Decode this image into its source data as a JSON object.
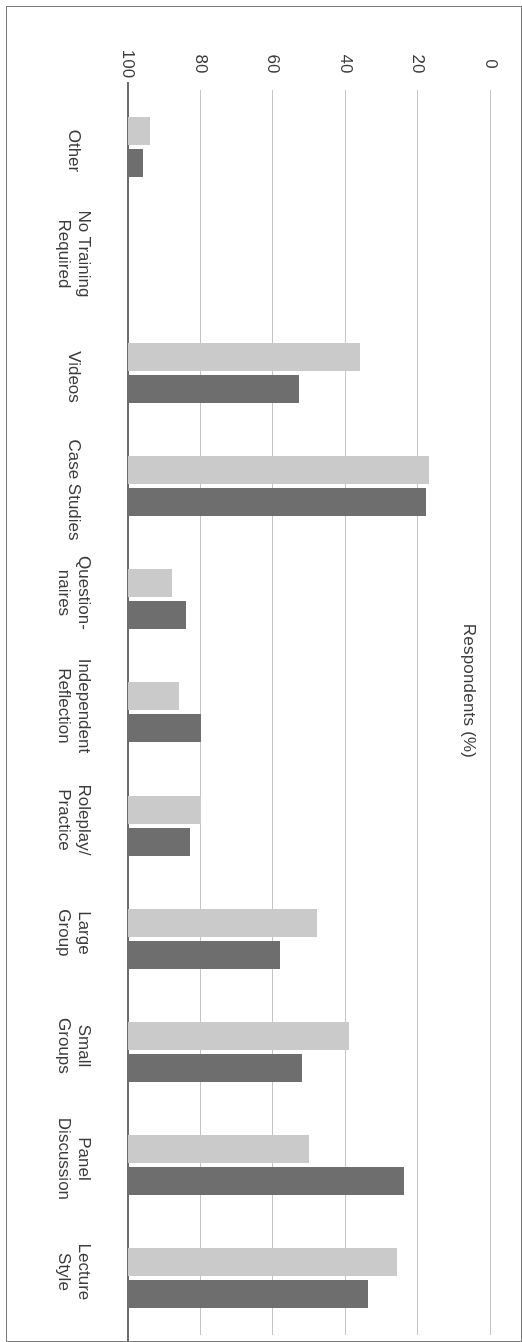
{
  "chart_data": {
    "type": "bar",
    "orientation": "horizontal",
    "title": "",
    "subtitle": "",
    "xlabel": "",
    "ylabel": "Respondents (%)",
    "value_axis_label": "Respondents (%)",
    "value_axis_ticks": [
      0,
      20,
      40,
      60,
      80,
      100
    ],
    "value_axis_tick_labels": [
      "0",
      "20",
      "40",
      "60",
      "80",
      "100"
    ],
    "ylim": [
      0,
      100
    ],
    "grid": true,
    "grid_axis": "value",
    "legend_position": "inside-right",
    "categories": [
      "Lecture Style",
      "Panel Discussion",
      "Small Groups",
      "Large Group",
      "Roleplay/ Practice",
      "Independent Reflection",
      "Question- naires",
      "Case Studies",
      "Videos",
      "No Training Required",
      "Other"
    ],
    "category_label_lines": [
      [
        "Lecture",
        "Style"
      ],
      [
        "Panel",
        "Discussion"
      ],
      [
        "Small",
        "Groups"
      ],
      [
        "Large",
        "Group"
      ],
      [
        "Roleplay/",
        "Practice"
      ],
      [
        "Independent",
        "Reflection"
      ],
      [
        "Question-",
        "naires"
      ],
      [
        "Case Studies"
      ],
      [
        "Videos"
      ],
      [
        "No Training",
        "Required"
      ],
      [
        "Other"
      ]
    ],
    "series": [
      {
        "name": "MSW",
        "color": "#cacaca",
        "values": [
          74,
          50,
          61,
          52,
          20,
          14,
          12,
          83,
          64,
          0,
          6
        ]
      },
      {
        "name": "BSW",
        "color": "#6e6e6e",
        "values": [
          66,
          76,
          48,
          42,
          17,
          20,
          16,
          82,
          47,
          0,
          4
        ]
      }
    ]
  },
  "legend": {
    "entries": [
      {
        "label": "MSW",
        "color": "#cacaca"
      },
      {
        "label": "BSW",
        "color": "#6e6e6e"
      }
    ]
  },
  "colors": {
    "msw": "#cacaca",
    "bsw": "#6e6e6e",
    "gridline": "#c4c4c4",
    "axis": "#6b6b6b",
    "text": "#3c3c3c",
    "frame": "#7a7a7a",
    "background": "#ffffff"
  }
}
